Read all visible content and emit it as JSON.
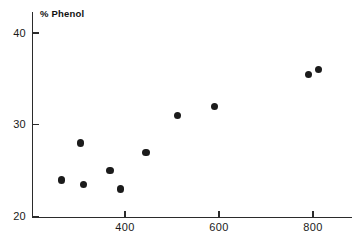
{
  "chart_data": {
    "type": "scatter",
    "title": "",
    "subtitle": "",
    "ylabel": "% Phenol",
    "xlabel": "",
    "xlim": [
      180,
      860
    ],
    "ylim": [
      20,
      41
    ],
    "grid": false,
    "legend": null,
    "xticks": [
      400,
      600,
      800
    ],
    "xticklabels": [
      "400",
      "600",
      "800"
    ],
    "yticks": [
      20,
      30,
      40
    ],
    "yticklabels": [
      "20",
      "30",
      "40"
    ],
    "marker": {
      "shape": "circle",
      "color": "#1b1b1b",
      "size": 7.5
    },
    "points": [
      {
        "x": 265,
        "y": 24.0
      },
      {
        "x": 305,
        "y": 28.0
      },
      {
        "x": 312,
        "y": 23.5
      },
      {
        "x": 368,
        "y": 25.0
      },
      {
        "x": 390,
        "y": 23.0
      },
      {
        "x": 445,
        "y": 27.0
      },
      {
        "x": 512,
        "y": 31.0
      },
      {
        "x": 590,
        "y": 32.0
      },
      {
        "x": 790,
        "y": 35.5
      },
      {
        "x": 812,
        "y": 36.0
      }
    ]
  },
  "axes": {
    "y_axis_name": "y-axis",
    "x_axis_name": "x-axis"
  }
}
